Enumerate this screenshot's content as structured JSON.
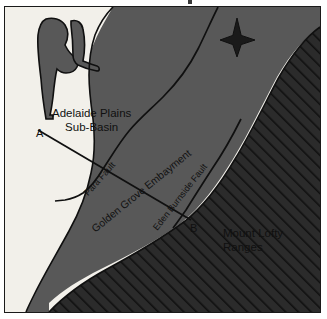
{
  "figure": {
    "domain": "map",
    "type": "geological-cross-section-locality-map",
    "width": 327,
    "height": 319
  },
  "map": {
    "regions": [
      {
        "name": "adelaide-plains-sub-basin",
        "label_line1": "Adelaide Plains",
        "label_line2": "Sub-Basin",
        "fill": "#585858",
        "pattern": "solid"
      },
      {
        "name": "golden-grove-embayment",
        "label": "Golden Grove Embayment",
        "fill": "#585858",
        "pattern": "solid"
      },
      {
        "name": "mount-lofty-ranges",
        "label_line1": "Mount Lofty",
        "label_line2": "Ranges",
        "fill": "#2b2b2b",
        "pattern": "diagonal-hatch"
      },
      {
        "name": "water-coast",
        "label": "",
        "fill": "#f2f0ea",
        "pattern": "solid"
      }
    ],
    "faults": [
      {
        "name": "para-fault",
        "label": "Para Fault"
      },
      {
        "name": "eden-burnside-fault",
        "label": "Eden Burnside Fault"
      }
    ],
    "cross_section": {
      "name": "cross-section-line-a-b",
      "start_label": "A",
      "end_label": "B"
    },
    "compass": {
      "name": "compass-rose",
      "style": "four-point-star",
      "north": "up"
    },
    "colors": {
      "basin_grey": "#585858",
      "ranges_dark": "#2b2b2b",
      "hatch_line": "#121212",
      "water_white": "#f2f0ea",
      "outline": "#101010",
      "frame": "#1a1a1a",
      "text": "#101010"
    }
  }
}
